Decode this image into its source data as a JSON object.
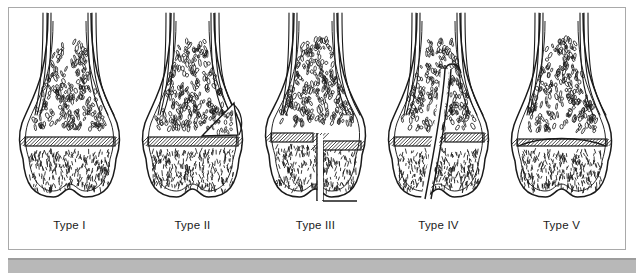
{
  "figure": {
    "panel_count": 5,
    "frame_color": "#a9a9a9",
    "background_color": "#ffffff",
    "bottom_bar_color": "#b8b8b8",
    "ink_color": "#1a1a1a",
    "label_color": "#1a1a1a"
  },
  "panels": [
    {
      "id": "type-1",
      "label": "Type I",
      "fracture": "transverse separation through the physis only",
      "physis": {
        "y": 126,
        "height": 9,
        "hatched": true,
        "split": false,
        "compressed": false
      },
      "metaphysis_fragment": false,
      "epiphysis_split_x": null,
      "oblique_fracture": false,
      "displaced": false
    },
    {
      "id": "type-2",
      "label": "Type II",
      "fracture": "physis plus triangular metaphyseal fragment",
      "physis": {
        "y": 126,
        "height": 9,
        "hatched": true,
        "split": false,
        "compressed": false
      },
      "metaphysis_fragment": true,
      "epiphysis_split_x": null,
      "oblique_fracture": false,
      "displaced": false
    },
    {
      "id": "type-3",
      "label": "Type III",
      "fracture": "physis plus vertical split through the epiphysis",
      "physis": {
        "y": 122,
        "height": 9,
        "hatched": true,
        "split": true,
        "compressed": false
      },
      "metaphysis_fragment": false,
      "epiphysis_split_x": 63,
      "oblique_fracture": false,
      "displaced": true
    },
    {
      "id": "type-4",
      "label": "Type IV",
      "fracture": "oblique fracture crossing metaphysis, physis and epiphysis",
      "physis": {
        "y": 126,
        "height": 9,
        "hatched": true,
        "split": true,
        "compressed": false
      },
      "metaphysis_fragment": false,
      "epiphysis_split_x": 62,
      "oblique_fracture": true,
      "displaced": true
    },
    {
      "id": "type-5",
      "label": "Type V",
      "fracture": "crush injury compressing the physis",
      "physis": {
        "y": 128,
        "height": 7,
        "hatched": true,
        "split": false,
        "compressed": true
      },
      "metaphysis_fragment": false,
      "epiphysis_split_x": null,
      "oblique_fracture": false,
      "displaced": false
    }
  ]
}
